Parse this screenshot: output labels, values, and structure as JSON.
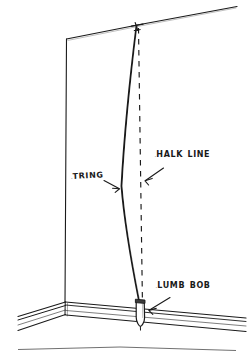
{
  "illustration": {
    "title": "Plumb bob and chalk line on wall corner",
    "style": "hand-drawn line diagram",
    "ink_color": "#1a1a1a",
    "background_color": "#ffffff"
  },
  "labels": {
    "chalk_line": "Chalk Line",
    "string": "String",
    "plumb_bob": "Plumb Bob"
  },
  "parts": {
    "wall": "wall-face",
    "ceiling": "ceiling-line",
    "baseboard": "baseboard-molding",
    "floor_corner": "floor-corner",
    "string_line": "hanging-string",
    "chalk_dashed_line": "dashed-chalk-line",
    "plumb_bob_weight": "plumb-bob-weight"
  }
}
